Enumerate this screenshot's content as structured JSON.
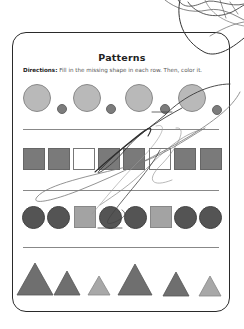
{
  "worksheet": {
    "title": "Patterns",
    "directions_label": "Directions:",
    "directions_text": " Fill in the missing shape in each row. Then, color it."
  },
  "rows": [
    {
      "name": "circles-large-small",
      "shapes": [
        "large-light-circle",
        "small-dark-circle",
        "large-light-circle",
        "small-dark-circle",
        "large-light-circle",
        "small-dark-circle",
        "large-light-circle",
        "small-dark-circle"
      ]
    },
    {
      "name": "squares",
      "shapes": [
        "dark-square",
        "dark-square",
        "empty-square",
        "dark-square",
        "dark-square",
        "empty-square",
        "dark-square",
        "dark-square"
      ]
    },
    {
      "name": "circles-and-squares",
      "shapes": [
        "dark-circle",
        "dark-circle",
        "light-square",
        "dark-circle",
        "dark-circle",
        "light-square",
        "dark-circle",
        "dark-circle"
      ]
    },
    {
      "name": "triangles",
      "shapes": [
        "large-triangle",
        "medium-triangle",
        "small-light-triangle",
        "large-triangle",
        "medium-triangle",
        "small-light-triangle"
      ]
    }
  ],
  "colors": {
    "light_circle": "#b9b9b9",
    "small_circle": "#7c7c7c",
    "dark_circle": "#545454",
    "dark_square": "#7a7a7a",
    "light_square": "#a3a3a3",
    "triangle_dark": "#6f6f6f",
    "triangle_light": "#a8a8a8",
    "scribble": "#3a3a3a"
  }
}
